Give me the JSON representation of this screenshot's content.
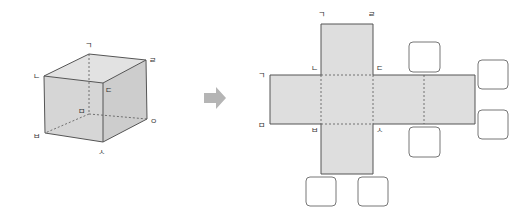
{
  "cube": {
    "vertices": {
      "g": {
        "label": "ㄱ",
        "x": 89,
        "y": 54
      },
      "n": {
        "label": "ㄴ",
        "x": 44,
        "y": 76
      },
      "d": {
        "label": "ㄷ",
        "x": 103,
        "y": 83
      },
      "r": {
        "label": "ㄹ",
        "x": 146,
        "y": 60
      },
      "m": {
        "label": "ㅁ",
        "x": 89,
        "y": 114
      },
      "b": {
        "label": "ㅂ",
        "x": 45,
        "y": 133
      },
      "s": {
        "label": "ㅅ",
        "x": 103,
        "y": 142
      },
      "o": {
        "label": "ㅇ",
        "x": 147,
        "y": 119
      }
    },
    "colors": {
      "top_face": "#e2e2e2",
      "front_face": "#d6d6d6",
      "right_face": "#cdcdcd",
      "edge": "#555555"
    }
  },
  "arrow": {
    "color": "#b5b5b5",
    "direction": "right"
  },
  "net": {
    "labels": {
      "top_left": "ㄱ",
      "top_right": "ㄹ",
      "mid_left_top": "ㄴ",
      "mid_right_top": "ㄷ",
      "strip_left_top": "ㄱ",
      "strip_left_bottom": "ㅁ",
      "mid_left_bottom": "ㅂ",
      "mid_right_bottom": "ㅅ"
    },
    "fill_color": "#dedede",
    "edge_color": "#555555",
    "answer_boxes": [
      {
        "id": "box-top",
        "value": ""
      },
      {
        "id": "box-right-top",
        "value": ""
      },
      {
        "id": "box-right-bottom",
        "value": ""
      },
      {
        "id": "box-under-strip",
        "value": ""
      },
      {
        "id": "box-bottom-left",
        "value": ""
      },
      {
        "id": "box-bottom-right",
        "value": ""
      }
    ]
  }
}
